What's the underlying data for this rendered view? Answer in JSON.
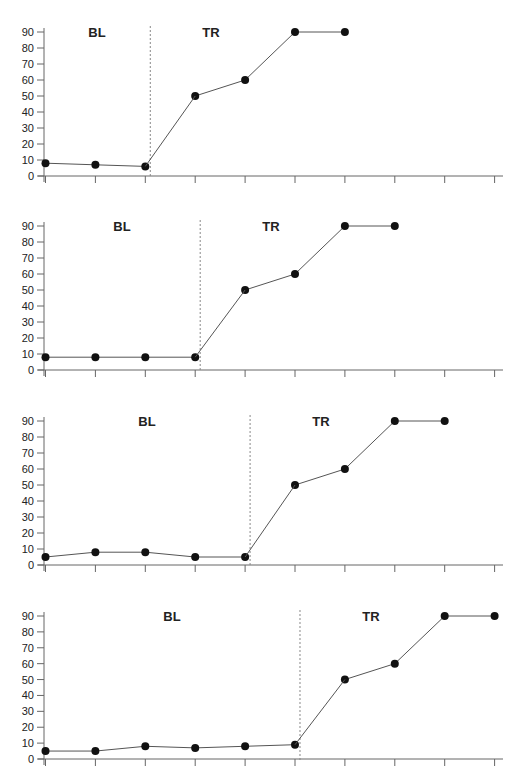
{
  "chart_data": [
    {
      "type": "line",
      "title": "",
      "xlabel": "",
      "ylabel": "",
      "ylim": [
        0,
        90
      ],
      "yticks": [
        0,
        10,
        20,
        30,
        40,
        50,
        60,
        70,
        80,
        90
      ],
      "x": [
        1,
        2,
        3,
        4,
        5,
        6,
        7,
        8,
        9,
        10
      ],
      "grid": false,
      "phases": [
        {
          "label": "BL",
          "x": [
            1,
            2,
            3
          ],
          "values": [
            8,
            7,
            6
          ]
        },
        {
          "label": "TR",
          "x": [
            4,
            5,
            6,
            7
          ],
          "values": [
            50,
            60,
            90,
            90
          ]
        }
      ],
      "phase_line_after_x": 3.1
    },
    {
      "type": "line",
      "title": "",
      "xlabel": "",
      "ylabel": "",
      "ylim": [
        0,
        90
      ],
      "yticks": [
        0,
        10,
        20,
        30,
        40,
        50,
        60,
        70,
        80,
        90
      ],
      "x": [
        1,
        2,
        3,
        4,
        5,
        6,
        7,
        8,
        9,
        10
      ],
      "grid": false,
      "phases": [
        {
          "label": "BL",
          "x": [
            1,
            2,
            3,
            4
          ],
          "values": [
            8,
            8,
            8,
            8
          ]
        },
        {
          "label": "TR",
          "x": [
            5,
            6,
            7,
            8
          ],
          "values": [
            50,
            60,
            90,
            90
          ]
        }
      ],
      "phase_line_after_x": 4.1
    },
    {
      "type": "line",
      "title": "",
      "xlabel": "",
      "ylabel": "",
      "ylim": [
        0,
        90
      ],
      "yticks": [
        0,
        10,
        20,
        30,
        40,
        50,
        60,
        70,
        80,
        90
      ],
      "x": [
        1,
        2,
        3,
        4,
        5,
        6,
        7,
        8,
        9,
        10
      ],
      "grid": false,
      "phases": [
        {
          "label": "BL",
          "x": [
            1,
            2,
            3,
            4,
            5
          ],
          "values": [
            5,
            8,
            8,
            5,
            5
          ]
        },
        {
          "label": "TR",
          "x": [
            6,
            7,
            8,
            9
          ],
          "values": [
            50,
            60,
            90,
            90
          ]
        }
      ],
      "phase_line_after_x": 5.1
    },
    {
      "type": "line",
      "title": "",
      "xlabel": "",
      "ylabel": "",
      "ylim": [
        0,
        90
      ],
      "yticks": [
        0,
        10,
        20,
        30,
        40,
        50,
        60,
        70,
        80,
        90
      ],
      "x": [
        1,
        2,
        3,
        4,
        5,
        6,
        7,
        8,
        9,
        10
      ],
      "grid": false,
      "phases": [
        {
          "label": "BL",
          "x": [
            1,
            2,
            3,
            4,
            5,
            6
          ],
          "values": [
            5,
            5,
            8,
            7,
            8,
            9
          ]
        },
        {
          "label": "TR",
          "x": [
            7,
            8,
            9,
            10
          ],
          "values": [
            50,
            60,
            90,
            90
          ]
        }
      ],
      "phase_line_after_x": 6.1
    }
  ],
  "layout": {
    "panels": [
      {
        "top90": 32,
        "base": 176,
        "bl_label_x": 97,
        "tr_label_x": 211
      },
      {
        "top90": 226,
        "base": 370,
        "bl_label_x": 122,
        "tr_label_x": 271
      },
      {
        "top90": 421,
        "base": 565,
        "bl_label_x": 147,
        "tr_label_x": 321
      },
      {
        "top90": 616,
        "base": 759,
        "bl_label_x": 172,
        "tr_label_x": 371
      }
    ],
    "x_axis_left": 44,
    "x_axis_right": 503,
    "x_first_tick": 45.5,
    "x_tick_spacing": 49.9,
    "line_color": "#555555",
    "marker_color": "#111111",
    "axis_color": "#666666"
  }
}
